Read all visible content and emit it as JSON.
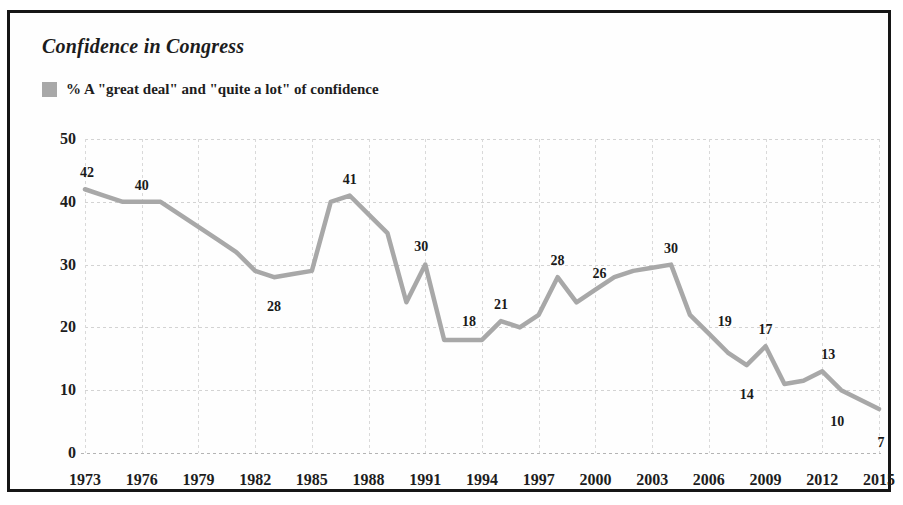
{
  "figure": {
    "title": "Confidence in Congress",
    "legend": {
      "label": "% A \"great deal\" and \"quite a lot\" of confidence",
      "color": "#a8a8a8"
    }
  },
  "chart_data": {
    "type": "line",
    "title": "Confidence in Congress",
    "series_name": "% A \"great deal\" and \"quite a lot\" of confidence",
    "xlabel": "",
    "ylabel": "",
    "xlim": [
      1973,
      2015
    ],
    "ylim": [
      0,
      50
    ],
    "grid": true,
    "legend_position": "top-left",
    "line_color": "#a8a8a8",
    "xtick_labels": [
      "1973",
      "1976",
      "1979",
      "1982",
      "1985",
      "1988",
      "1991",
      "1994",
      "1997",
      "2000",
      "2003",
      "2006",
      "2009",
      "2012",
      "2015"
    ],
    "xtick_values": [
      1973,
      1976,
      1979,
      1982,
      1985,
      1988,
      1991,
      1994,
      1997,
      2000,
      2003,
      2006,
      2009,
      2012,
      2015
    ],
    "ytick_labels": [
      "0",
      "10",
      "20",
      "30",
      "40",
      "50"
    ],
    "ytick_values": [
      0,
      10,
      20,
      30,
      40,
      50
    ],
    "x": [
      1973,
      1974,
      1975,
      1976,
      1977,
      1978,
      1979,
      1980,
      1981,
      1982,
      1983,
      1984,
      1985,
      1986,
      1987,
      1988,
      1989,
      1990,
      1991,
      1992,
      1993,
      1994,
      1995,
      1996,
      1997,
      1998,
      1999,
      2000,
      2001,
      2002,
      2003,
      2004,
      2005,
      2006,
      2007,
      2008,
      2009,
      2010,
      2011,
      2012,
      2013,
      2015
    ],
    "values": [
      42,
      41,
      40,
      40,
      40,
      38,
      36,
      34,
      32,
      29,
      28,
      28.5,
      29,
      40,
      41,
      38,
      35,
      24,
      30,
      18,
      18,
      18,
      21,
      20,
      22,
      28,
      24,
      26,
      28,
      29,
      29.5,
      30,
      22,
      19,
      16,
      14,
      17,
      11,
      11.5,
      13,
      10,
      7
    ],
    "annotations": [
      {
        "year": 1973,
        "value": 42,
        "label": "42"
      },
      {
        "year": 1976,
        "value": 40,
        "label": "40"
      },
      {
        "year": 1983,
        "value": 28,
        "label": "28"
      },
      {
        "year": 1987,
        "value": 41,
        "label": "41"
      },
      {
        "year": 1991,
        "value": 30,
        "label": "30"
      },
      {
        "year": 1993,
        "value": 18,
        "label": "18"
      },
      {
        "year": 1995,
        "value": 21,
        "label": "21"
      },
      {
        "year": 1998,
        "value": 28,
        "label": "28"
      },
      {
        "year": 2000,
        "value": 26,
        "label": "26"
      },
      {
        "year": 2004,
        "value": 30,
        "label": "30"
      },
      {
        "year": 2006,
        "value": 19,
        "label": "19"
      },
      {
        "year": 2008,
        "value": 14,
        "label": "14"
      },
      {
        "year": 2009,
        "value": 17,
        "label": "17"
      },
      {
        "year": 2012,
        "value": 13,
        "label": "13"
      },
      {
        "year": 2013,
        "value": 10,
        "label": "10"
      },
      {
        "year": 2015,
        "value": 7,
        "label": "7"
      }
    ]
  }
}
